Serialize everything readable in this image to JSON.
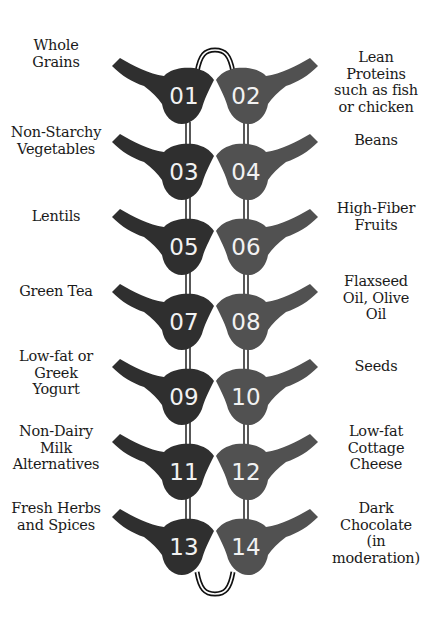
{
  "colors": {
    "left_shape": "#2f2f2f",
    "right_shape": "#515151",
    "connector": "#111111",
    "number_text": "#f2f2f2",
    "label_text": "#1a1a1a",
    "background": "#ffffff"
  },
  "items": [
    {
      "number": "01",
      "label_lines": [
        "Whole",
        "Grains"
      ],
      "side": "left"
    },
    {
      "number": "02",
      "label_lines": [
        "Lean",
        "Proteins",
        "such as fish",
        "or chicken"
      ],
      "side": "right"
    },
    {
      "number": "03",
      "label_lines": [
        "Non-Starchy",
        "Vegetables"
      ],
      "side": "left"
    },
    {
      "number": "04",
      "label_lines": [
        "Beans"
      ],
      "side": "right"
    },
    {
      "number": "05",
      "label_lines": [
        "Lentils"
      ],
      "side": "left"
    },
    {
      "number": "06",
      "label_lines": [
        "High-Fiber",
        "Fruits"
      ],
      "side": "right"
    },
    {
      "number": "07",
      "label_lines": [
        "Green Tea"
      ],
      "side": "left"
    },
    {
      "number": "08",
      "label_lines": [
        "Flaxseed",
        "Oil, Olive",
        "Oil"
      ],
      "side": "right"
    },
    {
      "number": "09",
      "label_lines": [
        "Low-fat or",
        "Greek",
        "Yogurt"
      ],
      "side": "left"
    },
    {
      "number": "10",
      "label_lines": [
        "Seeds"
      ],
      "side": "right"
    },
    {
      "number": "11",
      "label_lines": [
        "Non-Dairy",
        "Milk",
        "Alternatives"
      ],
      "side": "left"
    },
    {
      "number": "12",
      "label_lines": [
        "Low-fat",
        "Cottage",
        "Cheese"
      ],
      "side": "right"
    },
    {
      "number": "13",
      "label_lines": [
        "Fresh Herbs",
        "and Spices"
      ],
      "side": "left"
    },
    {
      "number": "14",
      "label_lines": [
        "Dark",
        "Chocolate",
        "(in",
        "moderation)"
      ],
      "side": "right"
    }
  ],
  "labels": {
    "i01": "Whole\nGrains",
    "i02": "Lean\nProteins\nsuch as fish\nor chicken",
    "i03": "Non-Starchy\nVegetables",
    "i04": "Beans",
    "i05": "Lentils",
    "i06": "High-Fiber\nFruits",
    "i07": "Green Tea",
    "i08": "Flaxseed\nOil, Olive\nOil",
    "i09": "Low-fat or\nGreek\nYogurt",
    "i10": "Seeds",
    "i11": "Non-Dairy\nMilk\nAlternatives",
    "i12": "Low-fat\nCottage\nCheese",
    "i13": "Fresh Herbs\nand Spices",
    "i14": "Dark\nChocolate\n(in\nmoderation)"
  },
  "numbers": {
    "n01": "01",
    "n02": "02",
    "n03": "03",
    "n04": "04",
    "n05": "05",
    "n06": "06",
    "n07": "07",
    "n08": "08",
    "n09": "09",
    "n10": "10",
    "n11": "11",
    "n12": "12",
    "n13": "13",
    "n14": "14"
  },
  "row_centers_y": [
    96,
    172,
    247,
    322,
    397,
    472,
    547
  ]
}
